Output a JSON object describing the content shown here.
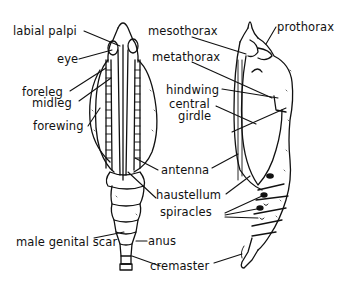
{
  "diagram": {
    "views": [
      "ventral view",
      "lateral view"
    ],
    "labels": {
      "labial_palpi": "labial palpi",
      "eye": "eye",
      "foreleg": "foreleg",
      "midleg": "midleg",
      "forewing": "forewing",
      "mesothorax": "mesothorax",
      "prothorax": "prothorax",
      "metathorax": "metathorax",
      "hindwing": "hindwing",
      "central": "central",
      "girdle": "girdle",
      "antenna": "antenna",
      "haustellum": "haustellum",
      "spiracles": "spiracles",
      "male_genital_scar": "male genital scar",
      "anus": "anus",
      "cremaster": "cremaster"
    }
  }
}
